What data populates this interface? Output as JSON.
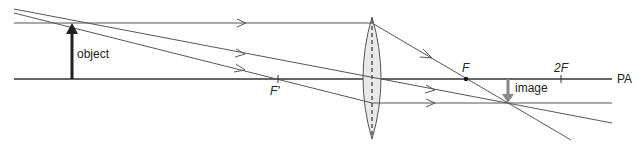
{
  "diagram": {
    "labels": {
      "object": "object",
      "image": "image",
      "principal_axis": "PA",
      "focal_point_near": "F'",
      "focal_point_far": "F",
      "twice_focal": "2F"
    },
    "colors": {
      "line": "#444444",
      "object_arrow": "#222222",
      "image_arrow": "#888888",
      "lens_fill": "#e6e6e6",
      "lens_stroke": "#555555"
    },
    "geometry": {
      "principal_axis_y": 79,
      "lens_x": 372,
      "object_x": 72,
      "object_top_y": 23,
      "f_prime_x": 278,
      "f_x": 466,
      "two_f_x": 561,
      "image_x": 508,
      "image_tip_y": 103
    }
  }
}
